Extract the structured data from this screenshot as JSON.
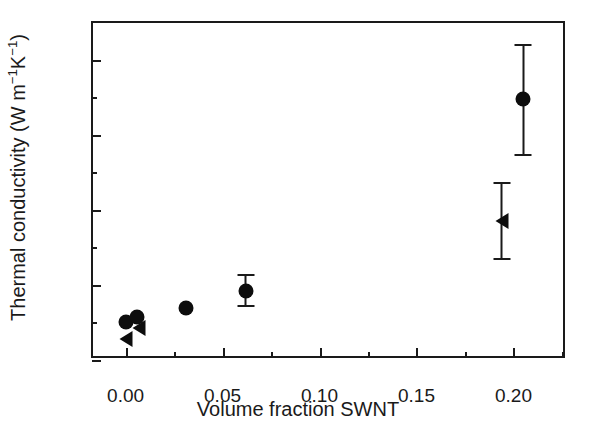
{
  "chart_data": {
    "type": "scatter",
    "title": "",
    "xlabel": "Volume fraction SWNT",
    "ylabel": "Thermal conductivity (W m−1K−1)",
    "ylabel_parts": {
      "prefix": "Thermal conductivity (W m",
      "sup1": "−1",
      "mid": "K",
      "sup2": "−1",
      "suffix": ")"
    },
    "xlim": [
      -0.0168,
      0.2276
    ],
    "ylim": [
      0.0,
      4.4933
    ],
    "grid": false,
    "legend": "none",
    "xticks": [
      {
        "value": 0.0,
        "label": "0.00"
      },
      {
        "value": 0.05,
        "label": "0.05"
      },
      {
        "value": 0.1,
        "label": "0.10"
      },
      {
        "value": 0.15,
        "label": "0.15"
      },
      {
        "value": 0.2,
        "label": "0.20"
      }
    ],
    "xticks_minor": [
      0.025,
      0.075,
      0.125,
      0.175,
      0.225
    ],
    "yticks": [
      {
        "value": 0,
        "label": "0"
      },
      {
        "value": 1,
        "label": "1"
      },
      {
        "value": 2,
        "label": "2"
      },
      {
        "value": 3,
        "label": "3"
      },
      {
        "value": 4,
        "label": "4"
      }
    ],
    "yticks_minor": [
      0.5,
      1.5,
      2.5,
      3.5
    ],
    "series": [
      {
        "name": "circles",
        "marker": "filled-circle",
        "color": "#0d0d0d",
        "points": [
          {
            "x": 0.0,
            "y": 0.5
          },
          {
            "x": 0.006,
            "y": 0.57
          },
          {
            "x": 0.031,
            "y": 0.69
          },
          {
            "x": 0.062,
            "y": 0.92,
            "yerr_low": 0.7,
            "yerr_high": 1.14
          },
          {
            "x": 0.205,
            "y": 3.48,
            "yerr_low": 2.72,
            "yerr_high": 4.21
          }
        ]
      },
      {
        "name": "triangles",
        "marker": "filled-left-triangle",
        "color": "#0d0d0d",
        "points": [
          {
            "x": 0.0,
            "y": 0.28
          },
          {
            "x": 0.007,
            "y": 0.42
          },
          {
            "x": 0.194,
            "y": 1.85,
            "yerr_low": 1.33,
            "yerr_high": 2.37
          }
        ]
      }
    ]
  }
}
